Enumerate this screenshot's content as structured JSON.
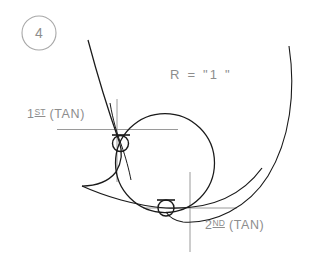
{
  "figure": {
    "step_badge": "4",
    "labels": {
      "first_tangent_num": "1",
      "first_tangent_ord": "ST",
      "first_tangent_rest": " (TAN)",
      "radius_note": "R  =  \"1  \"",
      "second_tangent_num": "2",
      "second_tangent_ord": "ND",
      "second_tangent_rest": " (TAN)"
    },
    "colors": {
      "ink": "#1a1a1a",
      "construction": "#9a9a9a",
      "text": "#8d8d8d",
      "background": "#ffffff"
    },
    "geometry": {
      "main_circle": {
        "cx": 165,
        "cy": 163,
        "r": 49.5
      },
      "first_tangent_point": {
        "x": 120.5,
        "y": 143.5
      },
      "second_tangent_point": {
        "x": 166,
        "y": 208
      },
      "tangent_marker_radius": 8,
      "cusp_point": {
        "x": 82,
        "y": 186
      },
      "step_badge_circle": {
        "cx": 39,
        "cy": 33,
        "r": 17
      }
    }
  }
}
